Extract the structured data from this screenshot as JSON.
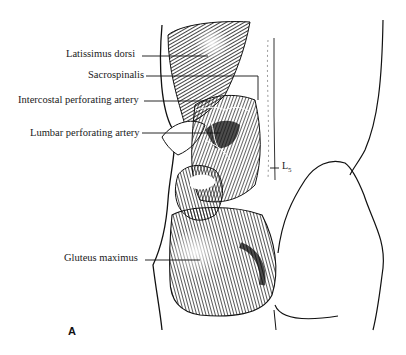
{
  "figure": {
    "panel_label": "A",
    "labels": [
      {
        "id": "latissimus",
        "text": "Latissimus dorsi"
      },
      {
        "id": "sacrospinalis",
        "text": "Sacrospinalis"
      },
      {
        "id": "intercostal",
        "text": "Intercostal  perforating artery"
      },
      {
        "id": "lumbar",
        "text": "Lumbar perforating artery"
      },
      {
        "id": "gluteus",
        "text": "Gluteus maximus"
      }
    ],
    "vertebra_label": {
      "main": "L",
      "sub": "5"
    },
    "colors": {
      "ink": "#111111",
      "background": "#ffffff"
    }
  }
}
